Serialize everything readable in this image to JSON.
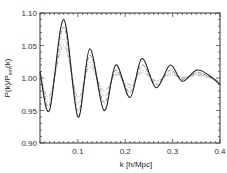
{
  "chart_data": {
    "type": "line",
    "title": "",
    "xlabel": "k [h/Mpc]",
    "ylabel": "P(k)/P_sm(k)",
    "ylabel_main": "P(k)/P",
    "ylabel_sub": "sm",
    "ylabel_tail": "(k)",
    "xlim": [
      0.02,
      0.4
    ],
    "ylim": [
      0.9,
      1.1
    ],
    "grid": false,
    "legend": null,
    "x_ticks": [
      0.1,
      0.2,
      0.3,
      0.4
    ],
    "x_tick_labels": [
      "0.1",
      "0.2",
      "0.3",
      "0.4"
    ],
    "y_ticks": [
      0.9,
      0.95,
      1.0,
      1.05,
      1.1
    ],
    "y_tick_labels": [
      "0.90",
      "0.95",
      "1.00",
      "1.05",
      "1.10"
    ],
    "series": [
      {
        "name": "solid",
        "style": "solid",
        "color": "#222222",
        "x": [
          0.02,
          0.04,
          0.07,
          0.1,
          0.125,
          0.155,
          0.18,
          0.21,
          0.235,
          0.265,
          0.295,
          0.32,
          0.35,
          0.375,
          0.4
        ],
        "y": [
          1.01,
          0.95,
          1.09,
          0.94,
          1.045,
          0.95,
          1.02,
          0.97,
          1.03,
          0.985,
          1.02,
          0.995,
          1.012,
          1.005,
          0.99
        ]
      },
      {
        "name": "dashed",
        "style": "dashed",
        "color": "#666666",
        "x": [
          0.02,
          0.04,
          0.07,
          0.1,
          0.125,
          0.155,
          0.18,
          0.21,
          0.235,
          0.265,
          0.295,
          0.32,
          0.35,
          0.375,
          0.4
        ],
        "y": [
          1.008,
          0.958,
          1.078,
          0.95,
          1.035,
          0.962,
          1.012,
          0.978,
          1.02,
          0.99,
          1.012,
          0.998,
          1.008,
          1.003,
          0.992
        ]
      },
      {
        "name": "dotted",
        "style": "dotted",
        "color": "#888888",
        "x": [
          0.02,
          0.04,
          0.07,
          0.1,
          0.125,
          0.155,
          0.18,
          0.21,
          0.235,
          0.265,
          0.295,
          0.32,
          0.35,
          0.375,
          0.4
        ],
        "y": [
          1.006,
          0.965,
          1.06,
          0.962,
          1.025,
          0.972,
          1.008,
          0.985,
          1.012,
          0.994,
          1.008,
          1.0,
          1.006,
          1.002,
          0.994
        ]
      },
      {
        "name": "dash-dot",
        "style": "dashdot",
        "color": "#999999",
        "x": [
          0.02,
          0.04,
          0.07,
          0.1,
          0.125,
          0.155,
          0.18,
          0.21,
          0.235,
          0.265,
          0.295,
          0.32,
          0.35,
          0.375,
          0.4
        ],
        "y": [
          1.004,
          0.972,
          1.05,
          0.97,
          1.018,
          0.98,
          1.005,
          0.99,
          1.008,
          0.996,
          1.005,
          1.001,
          1.004,
          1.001,
          0.995
        ]
      }
    ]
  }
}
